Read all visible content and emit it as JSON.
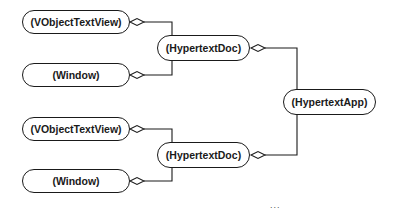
{
  "diagram": {
    "type": "object-composition",
    "nodes": [
      {
        "id": "vtv1",
        "label": "(VObjectTextView)"
      },
      {
        "id": "win1",
        "label": "(Window)"
      },
      {
        "id": "doc1",
        "label": "(HypertextDoc)"
      },
      {
        "id": "app",
        "label": "(HypertextApp)"
      },
      {
        "id": "vtv2",
        "label": "(VObjectTextView)"
      },
      {
        "id": "win2",
        "label": "(Window)"
      },
      {
        "id": "doc2",
        "label": "(HypertextDoc)"
      }
    ],
    "edges": [
      {
        "from": "vtv1",
        "to": "doc1",
        "end": "aggregation-diamond"
      },
      {
        "from": "win1",
        "to": "doc1",
        "end": "aggregation-diamond"
      },
      {
        "from": "doc1",
        "to": "app",
        "end": "aggregation-diamond"
      },
      {
        "from": "vtv2",
        "to": "doc2",
        "end": "aggregation-diamond"
      },
      {
        "from": "win2",
        "to": "doc2",
        "end": "aggregation-diamond"
      },
      {
        "from": "doc2",
        "to": "app",
        "end": "aggregation-diamond"
      }
    ],
    "continuation": "..."
  }
}
